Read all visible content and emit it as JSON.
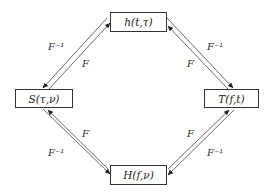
{
  "nodes": {
    "top": {
      "label": "h(t,τ)"
    },
    "left": {
      "label": "S(τ,ν)"
    },
    "right": {
      "label": "T(f,t)"
    },
    "bottom": {
      "label": "H(f,ν)"
    }
  },
  "edges": {
    "top_left": {
      "outer_label": "F⁻¹",
      "inner_label": "F"
    },
    "top_right": {
      "outer_label": "F⁻¹",
      "inner_label": "F"
    },
    "bottom_left": {
      "outer_label": "F⁻¹",
      "inner_label": "F"
    },
    "bottom_right": {
      "outer_label": "F⁻¹",
      "inner_label": "F"
    }
  },
  "colors": {
    "line": "#444444",
    "border": "#333333",
    "background": "#ffffff"
  }
}
